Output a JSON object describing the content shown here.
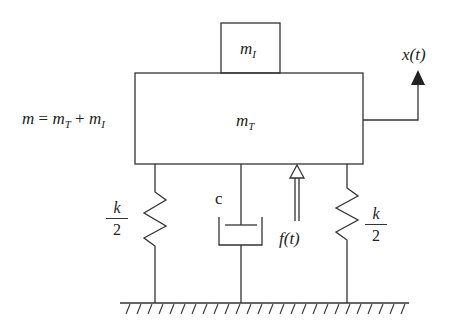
{
  "diagram": {
    "masses": {
      "top_mass_label": "m",
      "top_mass_sub": "I",
      "main_mass_label": "m",
      "main_mass_sub": "T"
    },
    "equation": {
      "lhs": "m",
      "eq": "=",
      "t1": "m",
      "t1_sub": "T",
      "plus": "+",
      "t2": "m",
      "t2_sub": "I"
    },
    "displacement": {
      "label": "x(t)"
    },
    "force": {
      "label": "f(t)"
    },
    "damper": {
      "label": "c"
    },
    "springs": [
      {
        "num": "k",
        "den": "2"
      },
      {
        "num": "k",
        "den": "2"
      }
    ],
    "colors": {
      "line": "#333333",
      "background": "#ffffff"
    }
  }
}
